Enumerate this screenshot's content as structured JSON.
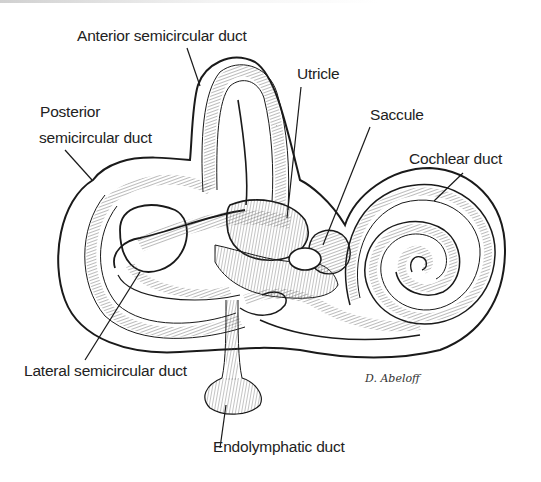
{
  "figure": {
    "labels": [
      {
        "id": "anterior",
        "text": "Anterior semicircular duct"
      },
      {
        "id": "posterior_line1",
        "text": "Posterior"
      },
      {
        "id": "posterior_line2",
        "text": "semicircular duct"
      },
      {
        "id": "utricle",
        "text": "Utricle"
      },
      {
        "id": "saccule",
        "text": "Saccule"
      },
      {
        "id": "cochlear",
        "text": "Cochlear duct"
      },
      {
        "id": "lateral",
        "text": "Lateral semicircular duct"
      },
      {
        "id": "endolymphatic",
        "text": "Endolymphatic duct"
      }
    ],
    "signature": "D. Abeloff",
    "colors": {
      "line": "#1a1a1a",
      "background": "#ffffff",
      "hatch": "#555555"
    }
  }
}
